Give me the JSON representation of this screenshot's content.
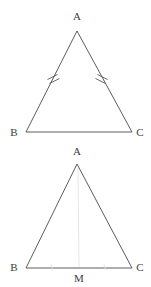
{
  "figure": {
    "kind": "geometry-diagram",
    "background_color": "#ffffff",
    "stroke_color": "#4a4a4a",
    "faint_stroke_color": "#e6e6e6",
    "tick_color": "#5a5a5a",
    "label_color": "#3d3d3d",
    "panels": [
      {
        "id": "upper",
        "name": "isosceles-triangle-with-congruent-legs",
        "vertices": {
          "apex": {
            "label": "A",
            "x": 77,
            "y": 31,
            "label_x": 77,
            "label_y": 20
          },
          "left": {
            "label": "B",
            "x": 26,
            "y": 132,
            "label_x": 14,
            "label_y": 136
          },
          "right": {
            "label": "C",
            "x": 132,
            "y": 132,
            "label_x": 140,
            "label_y": 136
          }
        },
        "sides": [
          {
            "name": "side-ab",
            "from": "apex",
            "to": "left",
            "ticks": 2
          },
          {
            "name": "side-ac",
            "from": "apex",
            "to": "right",
            "ticks": 2
          },
          {
            "name": "side-bc",
            "from": "left",
            "to": "right",
            "ticks": 0
          }
        ],
        "tick_marks": [
          {
            "name": "tick-ab",
            "side": "side-ab",
            "count": 2,
            "center_x": 53,
            "center_y": 79
          },
          {
            "name": "tick-ac",
            "side": "side-ac",
            "count": 2,
            "center_x": 102,
            "center_y": 79
          }
        ]
      },
      {
        "id": "lower",
        "name": "isosceles-triangle-with-median",
        "vertices": {
          "apex": {
            "label": "A",
            "x": 77,
            "y": 164,
            "label_x": 77,
            "label_y": 155
          },
          "left": {
            "label": "B",
            "x": 26,
            "y": 268,
            "label_x": 14,
            "label_y": 271
          },
          "right": {
            "label": "C",
            "x": 132,
            "y": 268,
            "label_x": 140,
            "label_y": 271
          }
        },
        "median": {
          "name": "median-am",
          "from": "apex",
          "to": "midpoint",
          "midpoint": {
            "label": "M",
            "x": 79,
            "y": 268,
            "label_x": 79,
            "label_y": 282
          },
          "faint": true
        },
        "sides": [
          {
            "name": "side-ab",
            "from": "apex",
            "to": "left",
            "ticks": 0
          },
          {
            "name": "side-ac",
            "from": "apex",
            "to": "right",
            "ticks": 0
          },
          {
            "name": "side-bm",
            "from": "left",
            "to": "midpoint",
            "ticks": 1
          },
          {
            "name": "side-mc",
            "from": "midpoint",
            "to": "right",
            "ticks": 1
          }
        ],
        "tick_marks": [
          {
            "name": "tick-bm",
            "side": "side-bm",
            "count": 1,
            "center_x": 52,
            "center_y": 268
          },
          {
            "name": "tick-mc",
            "side": "side-mc",
            "count": 1,
            "center_x": 105,
            "center_y": 268
          }
        ]
      }
    ]
  }
}
